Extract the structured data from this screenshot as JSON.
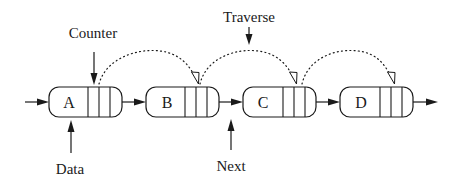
{
  "diagram": {
    "nodes": [
      {
        "label": "A",
        "x": 49,
        "y": 87,
        "w": 73,
        "h": 30,
        "dividers": [
          88,
          99,
          110
        ]
      },
      {
        "label": "B",
        "x": 146,
        "y": 87,
        "w": 73,
        "h": 30,
        "dividers": [
          185,
          196,
          207
        ]
      },
      {
        "label": "C",
        "x": 243,
        "y": 87,
        "w": 73,
        "h": 30,
        "dividers": [
          283,
          294,
          305
        ]
      },
      {
        "label": "D",
        "x": 340,
        "y": 87,
        "w": 73,
        "h": 30,
        "dividers": [
          380,
          391,
          402
        ]
      }
    ],
    "annotations": {
      "counter": "Counter",
      "traverse": "Traverse",
      "data": "Data",
      "next": "Next"
    },
    "colors": {
      "stroke": "#1a1a1a",
      "background": "#ffffff"
    }
  }
}
